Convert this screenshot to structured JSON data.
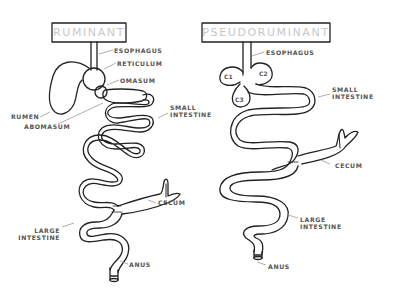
{
  "diagrams": [
    {
      "title": "RUMINANT",
      "labels": {
        "esophagus": "ESOPHAGUS",
        "reticulum": "RETICULUM",
        "omasum": "OMASUM",
        "rumen": "RUMEN",
        "abomasum": "ABOMASUM",
        "small_intestine_1": "SMALL",
        "small_intestine_2": "INTESTINE",
        "cecum": "CECUM",
        "large_intestine_1": "LARGE",
        "large_intestine_2": "INTESTINE",
        "anus": "ANUS"
      }
    },
    {
      "title": "PSEUDORUMINANT",
      "labels": {
        "esophagus": "ESOPHAGUS",
        "c1": "C1",
        "c2": "C2",
        "c3": "C3",
        "small_intestine_1": "SMALL",
        "small_intestine_2": "INTESTINE",
        "cecum": "CECUM",
        "large_intestine_1": "LARGE",
        "large_intestine_2": "INTESTINE",
        "anus": "ANUS"
      }
    }
  ],
  "colors": {
    "outline": "#222222",
    "title_text": "#c8c8c8",
    "label_text": "#555555",
    "leader_line": "#999999"
  }
}
